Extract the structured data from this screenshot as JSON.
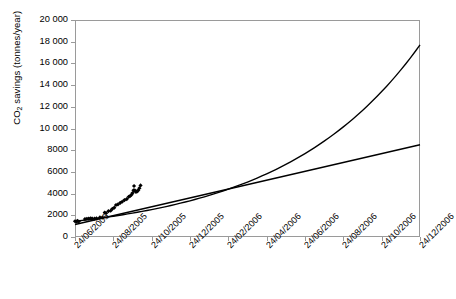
{
  "chart_data": {
    "type": "scatter",
    "title": "",
    "xlabel": "",
    "ylabel": "CO2 savings (tonnes/year)",
    "ylabel_rich": {
      "pre": "CO",
      "sub": "2",
      "post": " savings (tonnes/year)"
    },
    "ylim": [
      0,
      20000
    ],
    "ytick_step": 2000,
    "ytick_labels": [
      "20 000",
      "18 000",
      "16 000",
      "14 000",
      "12 000",
      "10 000",
      "8000",
      "6000",
      "4000",
      "2000",
      "0"
    ],
    "ytick_values": [
      20000,
      18000,
      16000,
      14000,
      12000,
      10000,
      8000,
      6000,
      4000,
      2000,
      0
    ],
    "xtick_labels": [
      "24/06/2005",
      "24/08/2005",
      "24/10/2005",
      "24/12/2005",
      "24/02/2006",
      "24/04/2006",
      "24/06/2006",
      "24/08/2006",
      "24/10/2006",
      "24/12/2006"
    ],
    "grid": false,
    "legend": "none",
    "series": [
      {
        "name": "Measured CO2 savings",
        "type": "scatter",
        "marker": "diamond",
        "color": "#000000",
        "x": [
          0.0,
          0.07,
          0.13,
          0.2,
          0.52,
          0.62,
          0.72,
          0.82,
          0.9,
          1.02,
          1.12,
          1.3,
          1.42,
          1.55,
          1.62,
          1.74,
          1.86,
          1.95,
          2.05,
          2.14,
          2.24,
          2.36,
          2.46,
          2.58,
          2.7,
          2.8,
          2.88,
          2.95,
          3.0,
          3.05,
          3.08,
          3.12,
          3.18,
          3.24,
          3.3,
          3.36,
          3.42
        ],
        "y": [
          1450,
          1420,
          1480,
          1430,
          1650,
          1680,
          1700,
          1720,
          1700,
          1690,
          1720,
          1800,
          1790,
          2250,
          2200,
          2380,
          2420,
          2600,
          2700,
          2950,
          3000,
          3150,
          3250,
          3400,
          3500,
          3700,
          3780,
          3900,
          4050,
          4300,
          4700,
          4300,
          4150,
          4200,
          4300,
          4500,
          4750
        ],
        "x_units": "months_after_24/06/2005"
      },
      {
        "name": "Exponential trend (extrapolated)",
        "type": "line",
        "color": "#000000",
        "description": "Upward-curving exponential fit from ~1450 at 24/06/2005 rising to ~17 700 at 24/12/2006",
        "start_value": 1450,
        "end_value": 17700
      },
      {
        "name": "Linear trend (extrapolated)",
        "type": "line",
        "color": "#000000",
        "description": "Straight-line fit from ~1150 at 24/06/2005 rising to ~8500 at 24/12/2006",
        "start_value": 1150,
        "end_value": 8500
      }
    ]
  },
  "style": {
    "axis_color": "#9a9a9a",
    "series_color": "#000000",
    "background": "#ffffff"
  }
}
